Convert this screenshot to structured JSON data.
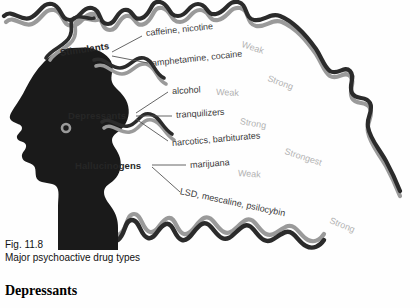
{
  "figure": {
    "caption_number": "Fig. 11.8",
    "caption_title": "Major psychoactive drug types",
    "silhouette_color": "#1a1a1a",
    "outline_dark_color": "#2b2b2b",
    "outline_gray_color": "#9a9a9a",
    "leader_line_color": "#555555"
  },
  "categories": [
    {
      "label": "Stimulants",
      "entries": [
        {
          "drugs": "caffeine, nicotine",
          "strength": "Weak"
        },
        {
          "drugs": "amphetamine, cocaine",
          "strength": "Strong"
        }
      ]
    },
    {
      "label": "Depressants",
      "entries": [
        {
          "drugs": "alcohol",
          "strength": "Weak"
        },
        {
          "drugs": "tranquilizers",
          "strength": "Strong"
        },
        {
          "drugs": "narcotics, barbiturates",
          "strength": "Strongest"
        }
      ]
    },
    {
      "label": "Hallucinogens",
      "entries": [
        {
          "drugs": "marijuana",
          "strength": "Weak"
        },
        {
          "drugs": "LSD, mescaline, psilocybin",
          "strength": "Strong"
        }
      ]
    }
  ],
  "page": {
    "section_heading": "Depressants"
  }
}
